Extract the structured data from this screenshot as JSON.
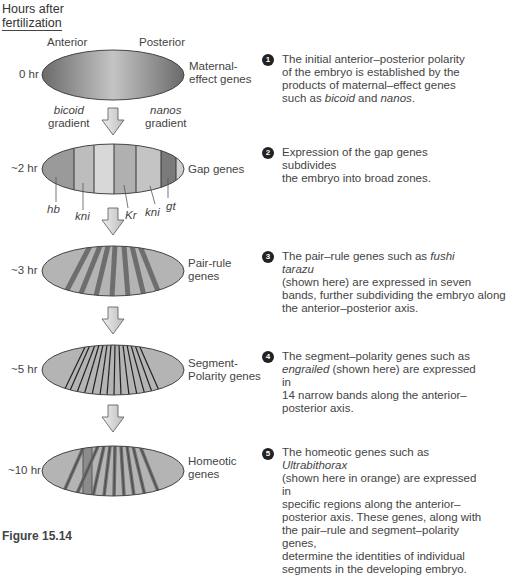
{
  "header": {
    "line1": "Hours after",
    "line2": "fertilization"
  },
  "axis": {
    "anterior": "Anterior",
    "posterior": "Posterior"
  },
  "stages": [
    {
      "number": "1",
      "time": "0 hr",
      "name_line1": "Maternal-",
      "name_line2": "effect genes",
      "gradient_labels": [
        {
          "italic": "bicoid",
          "text": "gradient"
        },
        {
          "italic": "nanos",
          "text": "gradient"
        }
      ],
      "desc_lines": [
        "The initial anterior–posterior polarity",
        "of the embryo is established by the",
        "products of maternal–effect genes"
      ],
      "desc_last": {
        "pre": "such as ",
        "i1": "bicoid",
        "mid": " and ",
        "i2": "nanos",
        "post": "."
      }
    },
    {
      "number": "2",
      "time": "~2 hr",
      "name_line1": "Gap genes",
      "name_line2": "",
      "gene_labels": [
        "hb",
        "kni",
        "Kr",
        "kni",
        "gt"
      ],
      "desc_lines": [
        "Expression of the gap genes subdivides",
        "the embryo into broad zones."
      ]
    },
    {
      "number": "3",
      "time": "~3 hr",
      "name_line1": "Pair-rule",
      "name_line2": "genes",
      "desc_first": {
        "pre": "The pair–rule genes such as ",
        "italic": "fushi tarazu"
      },
      "desc_lines": [
        "(shown here) are expressed in seven",
        "bands, further subdividing the embryo along",
        "the anterior–posterior axis."
      ]
    },
    {
      "number": "4",
      "time": "~5 hr",
      "name_line1": "Segment-",
      "name_line2": "Polarity genes",
      "desc_first_line": "The segment–polarity genes such as",
      "desc_second": {
        "italic": "engrailed",
        "post": " (shown here) are expressed in"
      },
      "desc_lines": [
        "14 narrow bands along the anterior–",
        "posterior axis."
      ]
    },
    {
      "number": "5",
      "time": "~10 hr",
      "name_line1": "Homeotic",
      "name_line2": "genes",
      "desc_first": {
        "pre": "The homeotic genes such as ",
        "italic": "Ultrabithorax"
      },
      "desc_lines": [
        "(shown here in orange) are expressed in",
        "specific regions along the anterior–",
        "posterior axis. These genes, along with",
        "the pair–rule and segment–polarity genes,",
        "determine the identities of individual",
        "segments in the developing embryo."
      ]
    }
  ],
  "caption": "Figure 15.14",
  "colors": {
    "embryo_fill": "#b0b0b0",
    "band_dark": "#6e6e6e",
    "outline": "#444444",
    "arrow_fill": "#d6d6d6"
  }
}
